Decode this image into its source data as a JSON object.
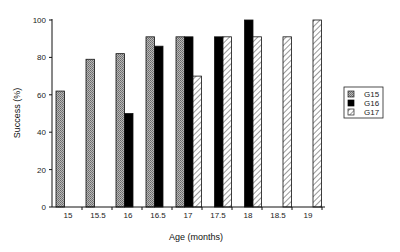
{
  "chart_data": {
    "type": "bar",
    "title": "",
    "xlabel": "Age (months)",
    "ylabel": "Success (%)",
    "ylim": [
      0,
      100
    ],
    "yticks": [
      0,
      20,
      40,
      60,
      80,
      100
    ],
    "grid": false,
    "legend_position": "right",
    "categories": [
      "15",
      "15.5",
      "16",
      "16.5",
      "17",
      "17.5",
      "18",
      "18.5",
      "19"
    ],
    "series": [
      {
        "name": "G15",
        "pattern": "dotted-gray",
        "values": [
          62,
          79,
          82,
          91,
          91,
          null,
          null,
          null,
          null
        ]
      },
      {
        "name": "G16",
        "pattern": "solid-black",
        "values": [
          null,
          null,
          50,
          86,
          91,
          91,
          100,
          null,
          null
        ]
      },
      {
        "name": "G17",
        "pattern": "diagonal-hatch",
        "values": [
          null,
          null,
          null,
          null,
          70,
          91,
          91,
          91,
          100
        ]
      }
    ]
  },
  "legend": {
    "items": [
      {
        "label": "G15"
      },
      {
        "label": "G16"
      },
      {
        "label": "G17"
      }
    ]
  },
  "axes": {
    "x_title": "Age (months)",
    "y_title": "Success (%)",
    "y_tick_labels": [
      "0",
      "20",
      "40",
      "60",
      "80",
      "100"
    ],
    "x_tick_labels": [
      "15",
      "15.5",
      "16",
      "16.5",
      "17",
      "17.5",
      "18",
      "18.5",
      "19"
    ]
  },
  "colors": {
    "g15_fill": "#9a9a9a",
    "g16_fill": "#000000",
    "g17_fill": "#ffffff",
    "stroke": "#111111"
  }
}
